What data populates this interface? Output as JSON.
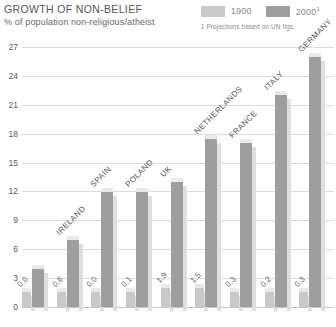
{
  "header": {
    "title": "GROWTH OF NON-BELIEF",
    "subtitle": "% of population non-religious/atheist"
  },
  "legend": {
    "series_1900_label": "1900",
    "series_2000_label": "2000",
    "series_2000_superscript": "1",
    "note": "1 Projections based on UN figs.",
    "color_1900": "#c9c9c9",
    "color_2000": "#9e9e9e"
  },
  "axis": {
    "y_ticks": [
      "27",
      "24",
      "21",
      "18",
      "15",
      "12",
      "9",
      "6",
      "3",
      "0"
    ]
  },
  "chart_data": {
    "type": "bar",
    "title": "GROWTH OF NON-BELIEF",
    "subtitle": "% of population non-religious/atheist",
    "xlabel": "",
    "ylabel": "% of population non-religious/atheist",
    "ylim": [
      0,
      27
    ],
    "ytick_step": 3,
    "grid": true,
    "legend_position": "top-right",
    "categories": [
      "",
      "IRELAND",
      "SPAIN",
      "POLAND",
      "UK",
      "NETHERLANDS",
      "FRANCE",
      "ITALY",
      "GERMANY"
    ],
    "series": [
      {
        "name": "1900",
        "color": "#c9c9c9",
        "values": [
          0.0,
          0.6,
          0.0,
          0.1,
          1.9,
          1.5,
          0.3,
          0.2,
          0.3
        ]
      },
      {
        "name": "2000",
        "color": "#9e9e9e",
        "values": [
          1.5,
          3.0,
          4.5,
          12.0,
          14.8,
          18.5,
          18.0,
          23.0,
          26.5
        ]
      }
    ],
    "data_labels_series": "1900",
    "notes": "1 Projections based on UN figs."
  },
  "bars": [
    {
      "country": "",
      "v1900": "0.0",
      "h1900": 5.6,
      "h2000": 14.8
    },
    {
      "country": "IRELAND",
      "v1900": "0.6",
      "h1900": 5.6,
      "h2000": 25.9
    },
    {
      "country": "SPAIN",
      "v1900": "0.0",
      "h1900": 5.6,
      "h2000": 44.4
    },
    {
      "country": "POLAND",
      "v1900": "0.1",
      "h1900": 5.6,
      "h2000": 44.4
    },
    {
      "country": "UK",
      "v1900": "1.9",
      "h1900": 7.4,
      "h2000": 48.1
    },
    {
      "country": "NETHERLANDS",
      "v1900": "1.5",
      "h1900": 7.4,
      "h2000": 64.8
    },
    {
      "country": "FRANCE",
      "v1900": "0.3",
      "h1900": 5.6,
      "h2000": 62.9
    },
    {
      "country": "ITALY",
      "v1900": "0.2",
      "h1900": 5.6,
      "h2000": 81.5
    },
    {
      "country": "GERMANY",
      "v1900": "0.3",
      "h1900": 5.6,
      "h2000": 96.3
    }
  ]
}
